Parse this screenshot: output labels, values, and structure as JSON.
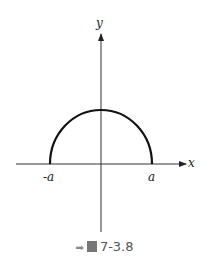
{
  "figure": {
    "caption_prefix": "圖",
    "caption_number": "7-3.8",
    "labels": {
      "y_axis": "y",
      "x_axis": "x",
      "neg_a": "-a",
      "pos_a": "a"
    }
  }
}
